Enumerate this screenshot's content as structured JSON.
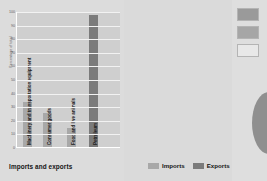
{
  "chart_data": {
    "type": "bar",
    "title": "",
    "xlabel": "Imports and exports",
    "ylabel": "Percentage of total",
    "categories": [
      "Machinery and transportation equipment",
      "Consumer goods",
      "Food and live animals",
      "Petroleum"
    ],
    "values": [
      33,
      25,
      14,
      97
    ],
    "ylim": [
      0,
      100
    ],
    "yticks": [
      "0",
      "10",
      "20",
      "30",
      "40",
      "50",
      "60",
      "70",
      "80",
      "90",
      "100"
    ],
    "grid": true,
    "legend_position": "bottom-right",
    "series": [
      {
        "name": "Imports",
        "color": "#a8a8a8"
      },
      {
        "name": "Exports",
        "color": "#7b7b7b"
      }
    ],
    "bar_series_assignment": [
      "Imports",
      "Imports",
      "Imports",
      "Exports"
    ]
  },
  "legend": {
    "items": [
      {
        "label": "Imports",
        "color": "#a8a8a8"
      },
      {
        "label": "Exports",
        "color": "#7b7b7b"
      }
    ]
  },
  "right_panel": {
    "swatches": [
      {
        "name": "swatch-filled-dark",
        "color": "#9a9a9a"
      },
      {
        "name": "swatch-filled-light",
        "color": "#a6a6a6"
      },
      {
        "name": "swatch-empty",
        "color": "#e8e8e8"
      }
    ],
    "shape": {
      "name": "oval-shape",
      "color": "#8f8f8f"
    }
  }
}
